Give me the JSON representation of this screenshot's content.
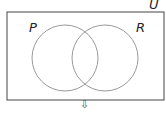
{
  "diagram": {
    "type": "venn",
    "universe_label": "U",
    "sets": [
      {
        "label": "P"
      },
      {
        "label": "R"
      }
    ],
    "arrow_glyph": "⇩",
    "colors": {
      "stroke": "#999999",
      "outline": "#333333",
      "text": "#222222"
    }
  },
  "bottom_caption": "(cut-off text)"
}
